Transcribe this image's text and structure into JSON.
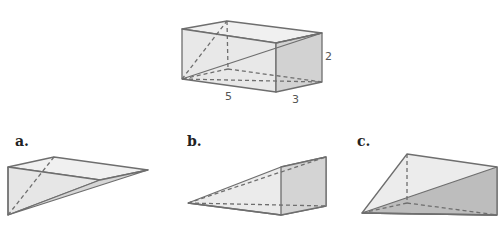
{
  "figure": {
    "main_prism": {
      "dimensions": {
        "length": "5",
        "width": "3",
        "height": "2"
      }
    },
    "options": [
      {
        "label": "a."
      },
      {
        "label": "b."
      },
      {
        "label": "c."
      }
    ],
    "colors": {
      "edge": "#6e6e6e",
      "face_light": "#ececec",
      "face_mid": "#dcdcdc",
      "face_dark": "#c8c8c8"
    }
  }
}
